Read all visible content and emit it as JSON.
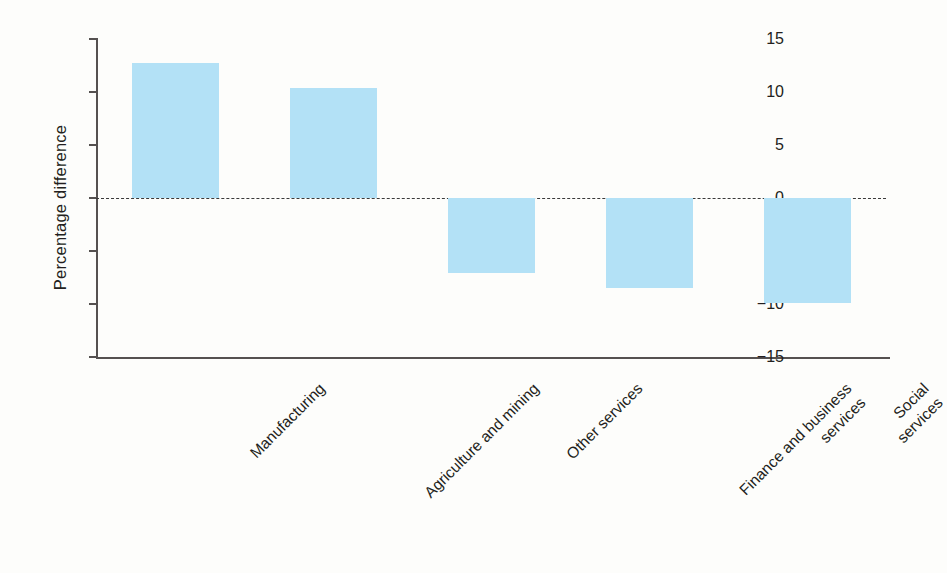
{
  "chart_data": {
    "type": "bar",
    "title": "",
    "subtitle": "",
    "xlabel": "",
    "ylabel": "Percentage difference",
    "categories": [
      "Manufacturing",
      "Agriculture and mining",
      "Other services",
      "Finance and business\nservices",
      "Social services"
    ],
    "values": [
      12.7,
      10.4,
      -7.1,
      -8.5,
      -9.9
    ],
    "ylim": [
      -15,
      15
    ],
    "yticks": [
      15,
      10,
      5,
      0,
      -5,
      -10,
      -15
    ],
    "ytick_labels": [
      "15",
      "10",
      "5",
      "0",
      "−5",
      "−10",
      "−15"
    ],
    "grid": false,
    "legend": null,
    "zero_line": true,
    "zero_line_style": "dashed",
    "bar_color": "#b3e1f6",
    "axis_color": "#555150",
    "text_color": "#231f20",
    "background_color": "#fdfdfb"
  }
}
